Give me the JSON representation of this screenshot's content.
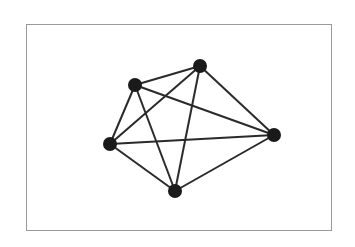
{
  "diagram": {
    "type": "complete-graph",
    "name": "K5",
    "colors": {
      "edge": "#2a2a2a",
      "node": "#1a1a1a",
      "frame": "#9a9a9a",
      "background": "#ffffff"
    },
    "nodes": [
      {
        "id": "n1",
        "x": 135,
        "y": 85
      },
      {
        "id": "n2",
        "x": 200,
        "y": 66
      },
      {
        "id": "n3",
        "x": 274,
        "y": 135
      },
      {
        "id": "n4",
        "x": 175,
        "y": 191
      },
      {
        "id": "n5",
        "x": 110,
        "y": 144
      }
    ],
    "edges": [
      [
        "n1",
        "n2"
      ],
      [
        "n1",
        "n3"
      ],
      [
        "n1",
        "n4"
      ],
      [
        "n1",
        "n5"
      ],
      [
        "n2",
        "n3"
      ],
      [
        "n2",
        "n4"
      ],
      [
        "n2",
        "n5"
      ],
      [
        "n3",
        "n4"
      ],
      [
        "n3",
        "n5"
      ],
      [
        "n4",
        "n5"
      ]
    ]
  }
}
